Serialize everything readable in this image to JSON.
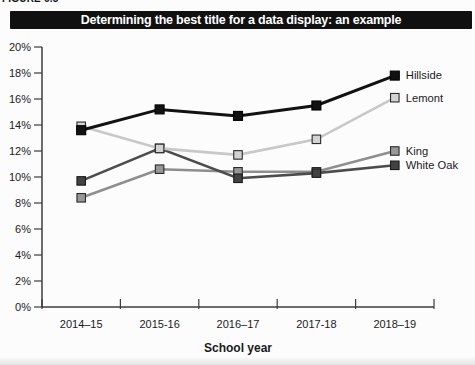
{
  "figure_label": "FIGURE 6.5",
  "header": {
    "title": "Determining the best title for a data display: an example",
    "bg_color": "#101010",
    "text_color": "#ffffff"
  },
  "chart_data": {
    "type": "line",
    "title": "Determining the best title for a data display: an example",
    "categories": [
      "2014–15",
      "2015-16",
      "2016–17",
      "2017-18",
      "2018–19"
    ],
    "xlabel": "School year",
    "ylabel": "",
    "ylim": [
      0,
      20
    ],
    "ytick_step": 2,
    "ytick_labels": [
      "0%",
      "2%",
      "4%",
      "6%",
      "8%",
      "10%",
      "12%",
      "14%",
      "16%",
      "18%",
      "20%"
    ],
    "grid": false,
    "legend_position": "labels-at-line-ends",
    "series": [
      {
        "name": "Hillside",
        "values": [
          13.6,
          15.2,
          14.7,
          15.5,
          17.8
        ],
        "color": "#121212",
        "marker_fill": "#121212",
        "marker_stroke": "#000000",
        "line_width": 3
      },
      {
        "name": "Lemont",
        "values": [
          13.9,
          12.2,
          11.7,
          12.9,
          16.1
        ],
        "color": "#c8c8c8",
        "marker_fill": "#d3d3d3",
        "marker_stroke": "#2a2a2a",
        "line_width": 2.6
      },
      {
        "name": "King",
        "values": [
          8.4,
          10.6,
          10.4,
          10.4,
          12.0
        ],
        "color": "#8e8e8e",
        "marker_fill": "#979797",
        "marker_stroke": "#2a2a2a",
        "line_width": 2.6
      },
      {
        "name": "White Oak",
        "values": [
          9.7,
          12.2,
          9.9,
          10.3,
          10.9
        ],
        "color": "#4c4c4c",
        "marker_fill": "#424242",
        "marker_stroke": "#1a1a1a",
        "line_width": 2.6
      }
    ]
  }
}
